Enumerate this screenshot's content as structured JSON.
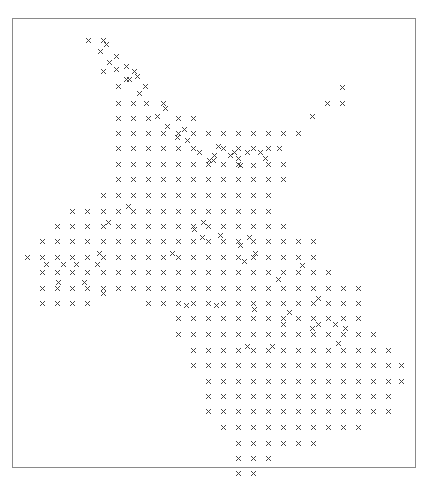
{
  "chart_data": {
    "type": "scatter",
    "title": "",
    "xlabel": "",
    "ylabel": "",
    "marker": "x",
    "marker_color": "#444444",
    "frame_color": "#8a8a8a",
    "grid": false,
    "legend": null,
    "axes_ticks_visible": false,
    "frame": {
      "left": 12,
      "top": 18,
      "right": 416,
      "bottom": 468
    },
    "grid_columns_x": [
      27,
      42,
      57,
      72,
      87,
      103,
      118,
      133,
      148,
      163,
      178,
      193,
      208,
      223,
      238,
      253,
      268,
      283,
      298,
      313,
      328,
      343,
      358,
      373,
      388,
      401
    ],
    "rows": [
      {
        "y": 40,
        "x": [
          88,
          103
        ]
      },
      {
        "y": 44,
        "x": [
          106
        ]
      },
      {
        "y": 51,
        "x": [
          100
        ]
      },
      {
        "y": 56,
        "x": [
          116
        ]
      },
      {
        "y": 62,
        "x": [
          109
        ]
      },
      {
        "y": 66,
        "x": [
          126
        ]
      },
      {
        "y": 69,
        "x": [
          116
        ]
      },
      {
        "y": 71,
        "x": [
          103,
          134
        ]
      },
      {
        "y": 76,
        "x": [
          137
        ]
      },
      {
        "y": 79,
        "x": [
          126,
          129
        ]
      },
      {
        "y": 86,
        "x": [
          118,
          145
        ]
      },
      {
        "y": 93,
        "x": [
          139
        ]
      },
      {
        "y": 87,
        "x": [
          342
        ]
      },
      {
        "y": 103,
        "x": [
          118,
          133,
          146,
          163,
          327,
          342
        ]
      },
      {
        "y": 108,
        "x": [
          165
        ]
      },
      {
        "y": 116,
        "x": [
          157,
          312
        ]
      },
      {
        "y": 118,
        "x": [
          118,
          133,
          148,
          178,
          193
        ]
      },
      {
        "y": 126,
        "x": [
          167
        ]
      },
      {
        "y": 133,
        "x": [
          118,
          133,
          148,
          163,
          178,
          193,
          208,
          223,
          238,
          253,
          268,
          283,
          298
        ]
      },
      {
        "y": 129,
        "x": [
          184
        ]
      },
      {
        "y": 137,
        "x": [
          177
        ]
      },
      {
        "y": 140,
        "x": [
          187
        ]
      },
      {
        "y": 146,
        "x": [
          218
        ]
      },
      {
        "y": 148,
        "x": [
          118,
          133,
          148,
          163,
          178,
          193,
          223,
          238,
          253,
          268,
          279
        ]
      },
      {
        "y": 152,
        "x": [
          199,
          234,
          247,
          260
        ]
      },
      {
        "y": 155,
        "x": [
          214,
          230
        ]
      },
      {
        "y": 158,
        "x": [
          238,
          265
        ]
      },
      {
        "y": 164,
        "x": [
          118,
          133,
          148,
          163,
          178,
          193,
          208,
          223,
          238,
          268,
          283
        ]
      },
      {
        "y": 165,
        "x": [
          240,
          253
        ]
      },
      {
        "y": 160,
        "x": [
          209,
          213
        ]
      },
      {
        "y": 179,
        "x": [
          118,
          133,
          148,
          163,
          178,
          193,
          208,
          223,
          238,
          253,
          268,
          283
        ]
      },
      {
        "y": 195,
        "x": [
          103,
          118,
          133,
          148,
          163,
          178,
          193,
          208,
          223,
          238,
          253,
          268
        ]
      },
      {
        "y": 211,
        "x": [
          72,
          87,
          103,
          118,
          133,
          148,
          163,
          178,
          193,
          208,
          223,
          238,
          253,
          268
        ]
      },
      {
        "y": 206,
        "x": [
          128
        ]
      },
      {
        "y": 226,
        "x": [
          57,
          72,
          87,
          103,
          118,
          133,
          148,
          163,
          178,
          193,
          208,
          223,
          238,
          253,
          268,
          283
        ]
      },
      {
        "y": 222,
        "x": [
          108,
          203
        ]
      },
      {
        "y": 229,
        "x": [
          194
        ]
      },
      {
        "y": 235,
        "x": [
          220
        ]
      },
      {
        "y": 241,
        "x": [
          42,
          57,
          72,
          87,
          103,
          118,
          133,
          148,
          163,
          178,
          193,
          208,
          223,
          238,
          253,
          268,
          283,
          298,
          313
        ]
      },
      {
        "y": 237,
        "x": [
          202,
          249
        ]
      },
      {
        "y": 245,
        "x": [
          240
        ]
      },
      {
        "y": 257,
        "x": [
          27,
          42,
          57,
          72,
          87,
          103,
          118,
          133,
          148,
          163,
          178,
          193,
          208,
          223,
          238,
          253,
          268,
          283,
          298,
          313
        ]
      },
      {
        "y": 253,
        "x": [
          99,
          172,
          255
        ]
      },
      {
        "y": 261,
        "x": [
          244
        ]
      },
      {
        "y": 264,
        "x": [
          46,
          63,
          76,
          97
        ]
      },
      {
        "y": 265,
        "x": [
          302
        ]
      },
      {
        "y": 272,
        "x": [
          42,
          57,
          72,
          87,
          103,
          118,
          133,
          148,
          163,
          178,
          193,
          208,
          223,
          238,
          253,
          268,
          283,
          298,
          313,
          328
        ]
      },
      {
        "y": 279,
        "x": [
          278
        ]
      },
      {
        "y": 282,
        "x": [
          58,
          84
        ]
      },
      {
        "y": 288,
        "x": [
          42,
          57,
          72,
          87,
          103,
          118,
          133,
          148,
          163,
          178,
          193,
          208,
          223,
          238,
          253,
          268,
          283,
          298,
          313,
          328,
          343,
          358
        ]
      },
      {
        "y": 293,
        "x": [
          103
        ]
      },
      {
        "y": 303,
        "x": [
          42,
          57,
          72,
          87,
          148,
          163,
          178,
          193,
          208,
          223,
          238,
          253,
          268,
          283,
          298,
          313,
          328,
          343,
          358
        ]
      },
      {
        "y": 305,
        "x": [
          186,
          216
        ]
      },
      {
        "y": 298,
        "x": [
          318
        ]
      },
      {
        "y": 309,
        "x": [
          254
        ]
      },
      {
        "y": 318,
        "x": [
          178,
          193,
          208,
          223,
          238,
          253,
          268,
          283,
          298,
          313,
          328,
          343,
          358
        ]
      },
      {
        "y": 312,
        "x": [
          289
        ]
      },
      {
        "y": 324,
        "x": [
          283,
          318,
          335
        ]
      },
      {
        "y": 334,
        "x": [
          178,
          193,
          208,
          223,
          238,
          253,
          268,
          283,
          298,
          313,
          328,
          343,
          358,
          373
        ]
      },
      {
        "y": 328,
        "x": [
          312,
          345
        ]
      },
      {
        "y": 343,
        "x": [
          338
        ]
      },
      {
        "y": 350,
        "x": [
          193,
          208,
          223,
          238,
          253,
          268,
          283,
          298,
          313,
          328,
          343,
          358,
          373,
          388
        ]
      },
      {
        "y": 346,
        "x": [
          247,
          272
        ]
      },
      {
        "y": 365,
        "x": [
          193,
          208,
          223,
          238,
          253,
          268,
          283,
          298,
          313,
          328,
          343,
          358,
          373,
          388,
          401
        ]
      },
      {
        "y": 381,
        "x": [
          208,
          223,
          238,
          253,
          268,
          283,
          298,
          313,
          328,
          343,
          358,
          373,
          388,
          401
        ]
      },
      {
        "y": 396,
        "x": [
          208,
          223,
          238,
          253,
          268,
          283,
          298,
          313,
          328,
          343,
          358,
          373,
          388
        ]
      },
      {
        "y": 411,
        "x": [
          208,
          223,
          238,
          253,
          268,
          283,
          298,
          313,
          328,
          343,
          358,
          373,
          388
        ]
      },
      {
        "y": 427,
        "x": [
          223,
          238,
          253,
          268,
          283,
          298,
          313,
          328,
          343,
          358
        ]
      },
      {
        "y": 443,
        "x": [
          238,
          253,
          268,
          283,
          298,
          313
        ]
      },
      {
        "y": 458,
        "x": [
          238,
          253,
          268
        ]
      },
      {
        "y": 473,
        "x": [
          238,
          253
        ]
      }
    ]
  }
}
